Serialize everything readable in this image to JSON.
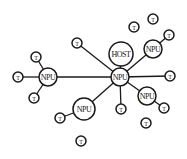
{
  "diagram": {
    "title": "",
    "colors": {
      "stroke": "#1a1a1a",
      "fill": "#ffffff"
    },
    "nodes": [
      {
        "id": "npu-center",
        "label": "NPU",
        "kind": "npu"
      },
      {
        "id": "host",
        "label": "HOST",
        "kind": "host"
      },
      {
        "id": "npu-left",
        "label": "NPU",
        "kind": "npu"
      },
      {
        "id": "npu-top-right",
        "label": "NPU",
        "kind": "npu"
      },
      {
        "id": "npu-right",
        "label": "NPU",
        "kind": "npu"
      },
      {
        "id": "npu-bottom-left",
        "label": "NPU",
        "kind": "npu"
      },
      {
        "id": "t1",
        "label": "T",
        "kind": "terminal"
      },
      {
        "id": "t2",
        "label": "T",
        "kind": "terminal"
      },
      {
        "id": "t3",
        "label": "T",
        "kind": "terminal"
      },
      {
        "id": "t4",
        "label": "T",
        "kind": "terminal"
      },
      {
        "id": "t5",
        "label": "T",
        "kind": "terminal"
      },
      {
        "id": "t6",
        "label": "T",
        "kind": "terminal"
      },
      {
        "id": "t7",
        "label": "T",
        "kind": "terminal"
      },
      {
        "id": "t8",
        "label": "T",
        "kind": "terminal"
      },
      {
        "id": "t9",
        "label": "T",
        "kind": "terminal"
      },
      {
        "id": "t10",
        "label": "T",
        "kind": "terminal"
      },
      {
        "id": "t11",
        "label": "T",
        "kind": "terminal"
      },
      {
        "id": "t12",
        "label": "T",
        "kind": "terminal"
      },
      {
        "id": "t13",
        "label": "T",
        "kind": "terminal"
      }
    ],
    "edges": [
      {
        "from": "npu-center",
        "to": "host"
      },
      {
        "from": "npu-center",
        "to": "npu-left"
      },
      {
        "from": "npu-center",
        "to": "npu-top-right"
      },
      {
        "from": "npu-center",
        "to": "npu-right"
      },
      {
        "from": "npu-center",
        "to": "npu-bottom-left"
      },
      {
        "from": "npu-center",
        "to": "t1"
      },
      {
        "from": "npu-center",
        "to": "t8"
      },
      {
        "from": "npu-center",
        "to": "t10"
      },
      {
        "from": "npu-left",
        "to": "t2"
      },
      {
        "from": "npu-left",
        "to": "t3"
      },
      {
        "from": "npu-left",
        "to": "t4"
      },
      {
        "from": "npu-top-right",
        "to": "t7"
      },
      {
        "from": "npu-right",
        "to": "t9"
      },
      {
        "from": "npu-bottom-left",
        "to": "t12"
      }
    ]
  }
}
